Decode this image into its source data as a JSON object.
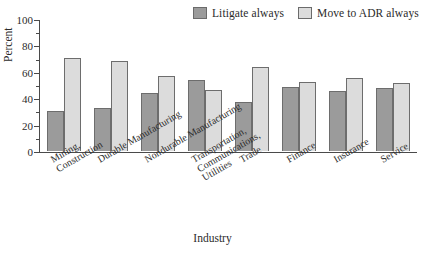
{
  "chart_data": {
    "type": "bar",
    "title": "",
    "subtitle": "",
    "xlabel": "Industry",
    "ylabel": "Percent",
    "ylim": [
      0,
      100
    ],
    "ytick_labels": [
      "0",
      "20",
      "40",
      "60",
      "80",
      "100"
    ],
    "ytick_values": [
      0,
      20,
      40,
      60,
      80,
      100
    ],
    "minor_tick_interval": 10,
    "grid": false,
    "legend_position": "top-right",
    "categories": [
      "Mining,\nConstruction",
      "Durable Manufacturing",
      "Nondurable Manufacturing",
      "Transportation,\nCommunications,\nUtilities",
      "Trade",
      "Finance",
      "Insurance",
      "Service"
    ],
    "category_lines": [
      [
        "Mining,",
        "Construction"
      ],
      [
        "Durable Manufacturing"
      ],
      [
        "Nondurable Manufacturing"
      ],
      [
        "Transportation,",
        "Communications,",
        "Utilities"
      ],
      [
        "Trade"
      ],
      [
        "Finance"
      ],
      [
        "Insurance"
      ],
      [
        "Service"
      ]
    ],
    "series": [
      {
        "name": "Litigate always",
        "color": "#9b9b9b",
        "values": [
          30.5,
          32.5,
          44.0,
          54.0,
          37.5,
          48.5,
          45.5,
          48.0
        ]
      },
      {
        "name": "Move to ADR always",
        "color": "#dcdcdc",
        "values": [
          70.5,
          68.0,
          56.5,
          46.5,
          63.5,
          52.0,
          55.0,
          51.5
        ]
      }
    ]
  },
  "legend": {
    "entries": [
      {
        "label": "Litigate always",
        "swatch": "dark"
      },
      {
        "label": "Move to ADR always",
        "swatch": "light"
      }
    ]
  },
  "colors": {
    "series_dark": "#9b9b9b",
    "series_light": "#dcdcdc",
    "axis": "#4a4a4a",
    "bar_border": "#6d6d6d",
    "text": "#2b2b2b",
    "background": "#ffffff"
  }
}
